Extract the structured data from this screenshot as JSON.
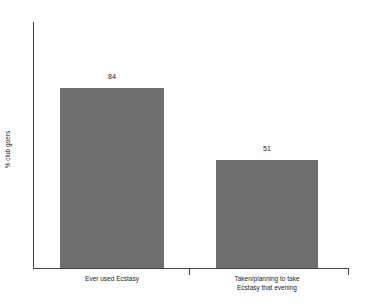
{
  "chart_data": {
    "type": "bar",
    "title": "",
    "subtitle": "",
    "xlabel": "",
    "ylabel": "% club goers",
    "categories": [
      "Ever used Ecstasy",
      "Taken/planning to take Ecstasy that evening"
    ],
    "category_lines": [
      [
        "Ever used Ecstasy"
      ],
      [
        "Taken/planning to take",
        "Ecstasy that evening"
      ]
    ],
    "values": [
      84,
      51
    ],
    "value_labels": [
      "84",
      "51"
    ],
    "ylim": [
      0,
      115
    ],
    "yticks": [],
    "ytick_labels": [],
    "grid": false,
    "legend": false,
    "legend_position": "none",
    "bar_color": "#6e6e6e",
    "axis_color": "#444444",
    "background_color": "#ffffff"
  },
  "axis": {
    "y_title": "% club goers"
  },
  "bars": [
    {
      "label": "Ever used Ecstasy",
      "value_label": "84"
    },
    {
      "label": "Taken/planning to take Ecstasy that evening",
      "value_label": "51"
    }
  ]
}
